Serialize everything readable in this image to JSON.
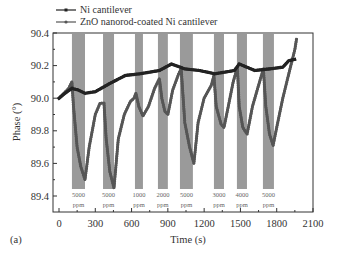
{
  "panel_label": "(a)",
  "chart_data": {
    "type": "line",
    "title": "",
    "xlabel": "Time (s)",
    "ylabel": "Phase (°)",
    "xlim": [
      0,
      2100
    ],
    "ylim": [
      89.4,
      90.4
    ],
    "xticks": [
      0,
      300,
      600,
      900,
      1200,
      1500,
      1800,
      2100
    ],
    "xtick_labels": [
      "0",
      "300",
      "600",
      "900",
      "1200",
      "1500",
      "1800",
      "2100"
    ],
    "yticks": [
      89.4,
      89.6,
      89.8,
      90.0,
      90.2,
      90.4
    ],
    "ytick_labels": [
      "89.4",
      "89.6",
      "89.8",
      "90.0",
      "90.2",
      "90.4"
    ],
    "grid": false,
    "legend_position": "top-left-outside",
    "legend": [
      "Ni cantilever",
      "ZnO nanorod-coated Ni cantilever"
    ],
    "exposure_bands": [
      {
        "start": 107,
        "end": 215,
        "label_top": "5000",
        "label_bottom": "ppm"
      },
      {
        "start": 364,
        "end": 455,
        "label_top": "5000",
        "label_bottom": "ppm"
      },
      {
        "start": 628,
        "end": 694,
        "label_top": "1000",
        "label_bottom": "ppm"
      },
      {
        "start": 818,
        "end": 900,
        "label_top": "2000",
        "label_bottom": "ppm"
      },
      {
        "start": 1000,
        "end": 1107,
        "label_top": "5000",
        "label_bottom": "ppm"
      },
      {
        "start": 1281,
        "end": 1364,
        "label_top": "3000",
        "label_bottom": "ppm"
      },
      {
        "start": 1471,
        "end": 1554,
        "label_top": "4000",
        "label_bottom": "ppm"
      },
      {
        "start": 1686,
        "end": 1777,
        "label_top": "5000",
        "label_bottom": "ppm"
      }
    ],
    "series": [
      {
        "name": "Ni cantilever",
        "color": "#222222",
        "marker": "square",
        "x": [
          0,
          50,
          107,
          160,
          215,
          300,
          420,
          550,
          670,
          830,
          930,
          1040,
          1160,
          1290,
          1450,
          1490,
          1620,
          1740,
          1850,
          1900,
          1960
        ],
        "y": [
          90.0,
          90.03,
          90.06,
          90.05,
          90.03,
          90.04,
          90.09,
          90.14,
          90.15,
          90.17,
          90.21,
          90.18,
          90.17,
          90.15,
          90.17,
          90.21,
          90.17,
          90.18,
          90.19,
          90.23,
          90.24
        ]
      },
      {
        "name": "ZnO nanorod-coated Ni cantilever",
        "color": "#555555",
        "marker": "circle",
        "x": [
          0,
          40,
          80,
          107,
          120,
          150,
          180,
          215,
          250,
          300,
          340,
          372,
          390,
          420,
          455,
          490,
          540,
          590,
          620,
          636,
          660,
          694,
          740,
          790,
          830,
          850,
          875,
          900,
          940,
          990,
          1010,
          1040,
          1080,
          1115,
          1150,
          1200,
          1260,
          1281,
          1300,
          1340,
          1364,
          1400,
          1440,
          1475,
          1490,
          1520,
          1555,
          1600,
          1650,
          1690,
          1710,
          1740,
          1770,
          1800,
          1850,
          1900,
          1950,
          1965
        ],
        "y": [
          90.0,
          90.03,
          90.06,
          90.1,
          89.95,
          89.7,
          89.58,
          89.5,
          89.7,
          89.9,
          89.97,
          89.97,
          89.75,
          89.55,
          89.45,
          89.75,
          89.9,
          89.98,
          90.0,
          90.03,
          89.95,
          89.89,
          89.95,
          90.06,
          90.12,
          90.0,
          89.92,
          89.9,
          90.05,
          90.15,
          90.18,
          89.85,
          89.7,
          89.6,
          89.85,
          90.0,
          90.08,
          90.14,
          89.95,
          89.84,
          89.82,
          89.95,
          90.1,
          90.19,
          89.95,
          89.82,
          89.78,
          89.95,
          90.08,
          90.18,
          89.95,
          89.78,
          89.71,
          89.82,
          90.0,
          90.15,
          90.3,
          90.37
        ]
      }
    ]
  }
}
